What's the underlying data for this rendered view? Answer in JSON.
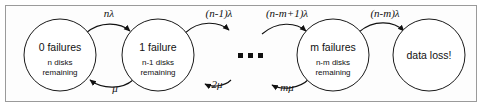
{
  "figure": {
    "border_color": "#9a9a9a",
    "background_color": "#fdfdfd",
    "stroke_color": "#111111"
  },
  "states": [
    {
      "id": "state-0-failures",
      "title": "0 failures",
      "sub_line1": "n disks",
      "sub_line2": "remaining",
      "cx": 60,
      "cy": 55,
      "r": 36
    },
    {
      "id": "state-1-failure",
      "title": "1 failure",
      "sub_line1": "n-1 disks",
      "sub_line2": "remaining",
      "cx": 158,
      "cy": 55,
      "r": 36
    },
    {
      "id": "state-m-failures",
      "title": "m failures",
      "sub_line1": "n-m disks",
      "sub_line2": "remaining",
      "cx": 333,
      "cy": 55,
      "r": 36
    },
    {
      "id": "state-data-loss",
      "title": "data loss!",
      "sub_line1": "",
      "sub_line2": "",
      "cx": 429,
      "cy": 55,
      "r": 36
    }
  ],
  "failure_transitions": [
    {
      "id": "rate-n-lambda",
      "label": "nλ",
      "x": 109,
      "y": 17
    },
    {
      "id": "rate-n-minus-1-lambda",
      "label": "(n-1)λ",
      "x": 219,
      "y": 17
    },
    {
      "id": "rate-n-minus-m-plus-1-lambda",
      "label": "(n-m+1)λ",
      "x": 287,
      "y": 17
    },
    {
      "id": "rate-n-minus-m-lambda",
      "label": "(n-m)λ",
      "x": 385,
      "y": 17
    }
  ],
  "repair_transitions": [
    {
      "id": "rate-mu",
      "label": "μ",
      "x": 115,
      "y": 92
    },
    {
      "id": "rate-2-mu",
      "label": "2μ",
      "x": 217,
      "y": 88
    },
    {
      "id": "rate-m-mu",
      "label": "mμ",
      "x": 287,
      "y": 91
    }
  ],
  "ellipsis": {
    "id": "ellipsis",
    "label": "• • •",
    "dots": [
      {
        "cx": 241,
        "cy": 56
      },
      {
        "cx": 251,
        "cy": 56
      },
      {
        "cx": 261,
        "cy": 56
      }
    ]
  }
}
